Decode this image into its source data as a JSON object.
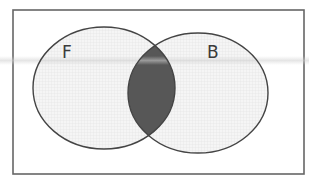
{
  "diagram": {
    "type": "venn",
    "universe": {
      "x": 13,
      "y": 10,
      "width": 291,
      "height": 164,
      "stroke": "#666666"
    },
    "sets": [
      {
        "id": "F",
        "label": "F",
        "cx": 104,
        "cy": 88,
        "rx": 71,
        "ry": 61,
        "label_x": 62,
        "label_y": 58
      },
      {
        "id": "B",
        "label": "B",
        "cx": 198,
        "cy": 93,
        "rx": 70,
        "ry": 60,
        "label_x": 207,
        "label_y": 58
      }
    ],
    "shaded_region": "F ∩ B",
    "colors": {
      "outline": "#444444",
      "set_fill": "#f3f3f3",
      "grid_line": "#e2e2e2",
      "intersection_fill": "#575757",
      "background": "#ffffff",
      "scan_streak": "#d8d8d8"
    }
  }
}
